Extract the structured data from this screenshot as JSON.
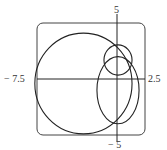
{
  "chart_data": {
    "type": "line",
    "subtype": "polar-curve",
    "title": "",
    "xlabel": "",
    "ylabel": "",
    "xlim": [
      -7.5,
      2.5
    ],
    "ylim": [
      -5,
      5
    ],
    "grid": false,
    "legend": null,
    "tick_labels": {
      "x_min": "− 7.5",
      "x_max": "2.5",
      "y_max": "5",
      "y_min": "− 5"
    },
    "curves": [
      {
        "name": "outer-loop",
        "shape": "approx-circle",
        "center": [
          -3.2,
          -0.4
        ],
        "rx": 4.5,
        "ry": 4.5
      },
      {
        "name": "middle-loop",
        "shape": "approx-ellipse",
        "center": [
          0.0,
          -1.0
        ],
        "rx": 1.95,
        "ry": 3.0
      },
      {
        "name": "inner-loop",
        "shape": "approx-circle",
        "center": [
          0.0,
          1.7
        ],
        "rx": 1.3,
        "ry": 1.35
      }
    ],
    "colors": {
      "curve": "#222222",
      "axes": "#222222",
      "frame": "#444444"
    }
  }
}
